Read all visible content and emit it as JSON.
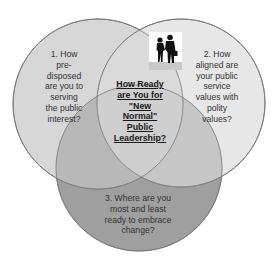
{
  "diagram": {
    "type": "venn",
    "circles": [
      {
        "id": 1,
        "label": "1. How pre-disposed are you to serving the public interest?",
        "lines": [
          "1. How",
          "pre-",
          "disposed",
          "are you to",
          "serving",
          "the public",
          "interest?"
        ],
        "fill": "#d6d6d6"
      },
      {
        "id": 2,
        "label": "2. How aligned are your public service values with polity values?",
        "lines": [
          "2. How",
          "aligned are",
          "your public",
          "service",
          "values with",
          "polity",
          "values?"
        ],
        "fill": "#e2e2e2"
      },
      {
        "id": 3,
        "label": "3. Where are you most and least ready to embrace change?",
        "lines": [
          "3. Where are you",
          "most and least",
          "ready to embrace",
          "change?"
        ],
        "fill": "#9e9e9e"
      }
    ],
    "center": {
      "label": "How Ready are You for \"New Normal\" Public Leadership?",
      "lines": [
        "How Ready",
        "are You for",
        "\"New",
        "Normal\"",
        "Public",
        "Leadership?"
      ]
    },
    "image": {
      "description": "two business people silhouettes shaking hands"
    },
    "colors": {
      "outline": "#7a7a7a",
      "text": "#333333"
    }
  }
}
